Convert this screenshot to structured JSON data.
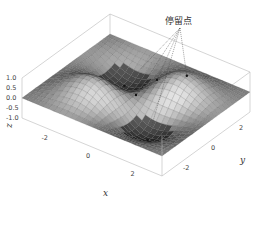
{
  "chart_data": {
    "type": "surface3d",
    "title": "",
    "function": "z = sin(x) * sin(y) * exp(-(x^2 + y^2) / 8)",
    "xlabel": "x",
    "ylabel": "y",
    "zlabel": "z",
    "xlim": [
      -3.14,
      3.14
    ],
    "ylim": [
      -3.14,
      3.14
    ],
    "zlim": [
      -1.0,
      1.0
    ],
    "xticks": [
      "-2",
      "0",
      "2"
    ],
    "xtick_values": [
      -2,
      0,
      2
    ],
    "yticks": [
      "-2",
      "0",
      "2"
    ],
    "ytick_values": [
      -2,
      0,
      2
    ],
    "zticks": [
      "1.0",
      "0.5",
      "0.0",
      "-0.5",
      "-1.0"
    ],
    "ztick_values": [
      1.0,
      0.5,
      0.0,
      -0.5,
      -1.0
    ],
    "colormap": "gray",
    "annotation": {
      "text": "停留点",
      "points": [
        {
          "x": -1.4,
          "y": 1.4,
          "kind": "max"
        },
        {
          "x": 0.0,
          "y": 0.0,
          "kind": "saddle"
        },
        {
          "x": 1.4,
          "y": 1.4,
          "kind": "min"
        },
        {
          "x": 0.0,
          "y": 1.5,
          "kind": "saddle"
        },
        {
          "x": 1.4,
          "y": -1.4,
          "kind": "max"
        }
      ]
    }
  }
}
